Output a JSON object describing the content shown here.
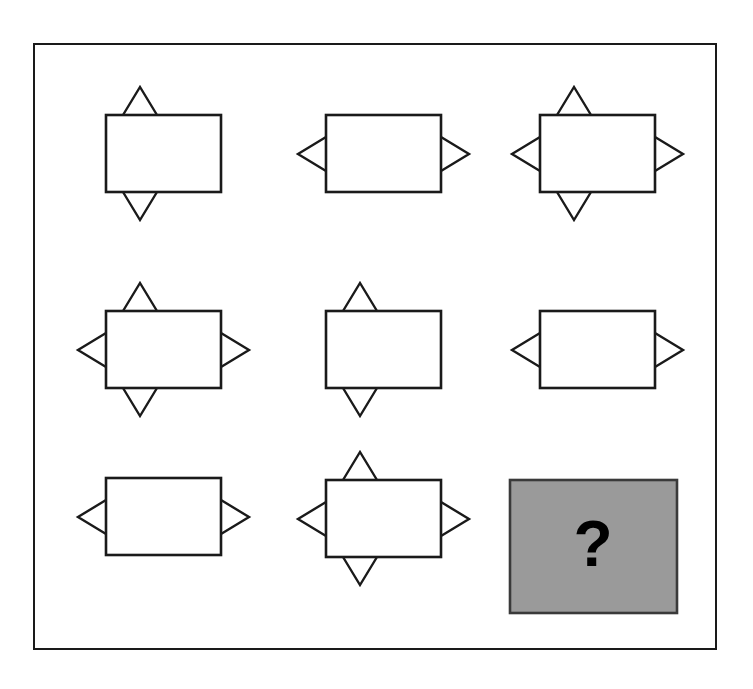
{
  "puzzle": {
    "title": "Matrix Reasoning Puzzle",
    "type": "3x3 figural analogy matrix",
    "grid": {
      "rows": 3,
      "columns": 3
    },
    "frame": {
      "border_color": "#1a1a1a",
      "background_color": "#ffffff"
    },
    "figure_style": {
      "stroke_color": "#1a1a1a",
      "fill_color": "#ffffff",
      "answer_fill_color": "#9a9a9a",
      "answer_border_color": "#3a3a3a",
      "mark_color": "#000000"
    },
    "cells": [
      {
        "id": "cell-r1c1",
        "row": 1,
        "column": 1,
        "name": "rectangle-with-top-and-bottom-triangles",
        "shape": "rectangle",
        "triangles": [
          "top",
          "bottom"
        ],
        "is_answer": false,
        "label": ""
      },
      {
        "id": "cell-r1c2",
        "row": 1,
        "column": 2,
        "name": "rectangle-with-left-and-right-triangles",
        "shape": "rectangle",
        "triangles": [
          "left",
          "right"
        ],
        "is_answer": false,
        "label": ""
      },
      {
        "id": "cell-r1c3",
        "row": 1,
        "column": 3,
        "name": "rectangle-with-four-triangles",
        "shape": "rectangle",
        "triangles": [
          "top",
          "bottom",
          "left",
          "right"
        ],
        "is_answer": false,
        "label": ""
      },
      {
        "id": "cell-r2c1",
        "row": 2,
        "column": 1,
        "name": "rectangle-with-four-triangles",
        "shape": "rectangle",
        "triangles": [
          "top",
          "bottom",
          "left",
          "right"
        ],
        "is_answer": false,
        "label": ""
      },
      {
        "id": "cell-r2c2",
        "row": 2,
        "column": 2,
        "name": "rectangle-with-top-and-bottom-triangles",
        "shape": "rectangle",
        "triangles": [
          "top",
          "bottom"
        ],
        "is_answer": false,
        "label": ""
      },
      {
        "id": "cell-r2c3",
        "row": 2,
        "column": 3,
        "name": "rectangle-with-left-and-right-triangles",
        "shape": "rectangle",
        "triangles": [
          "left",
          "right"
        ],
        "is_answer": false,
        "label": ""
      },
      {
        "id": "cell-r3c1",
        "row": 3,
        "column": 1,
        "name": "rectangle-with-left-and-right-triangles",
        "shape": "rectangle",
        "triangles": [
          "left",
          "right"
        ],
        "is_answer": false,
        "label": ""
      },
      {
        "id": "cell-r3c2",
        "row": 3,
        "column": 2,
        "name": "rectangle-with-four-triangles",
        "shape": "rectangle",
        "triangles": [
          "top",
          "bottom",
          "left",
          "right"
        ],
        "is_answer": false,
        "label": ""
      },
      {
        "id": "cell-r3c3",
        "row": 3,
        "column": 3,
        "name": "missing-answer-cell",
        "shape": "rectangle",
        "triangles": [],
        "is_answer": true,
        "label": "?"
      }
    ]
  }
}
